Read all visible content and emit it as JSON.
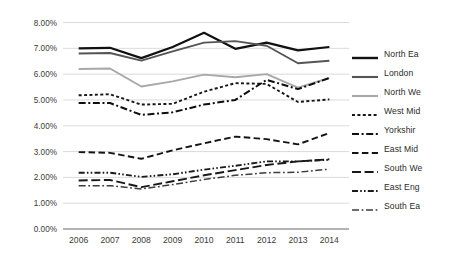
{
  "chart_data": {
    "type": "line",
    "title": "",
    "xlabel": "",
    "ylabel": "",
    "categories": [
      "2006",
      "2007",
      "2008",
      "2009",
      "2010",
      "2011",
      "2012",
      "2013",
      "2014"
    ],
    "x_tick_labels": [
      "2006",
      "2007",
      "2008",
      "2009",
      "2010",
      "2011",
      "2012",
      "2013",
      "2014"
    ],
    "y_tick_labels": [
      "0.00%",
      "1.00%",
      "2.00%",
      "3.00%",
      "4.00%",
      "5.00%",
      "6.00%",
      "7.00%",
      "8.00%"
    ],
    "y_tick_values": [
      0,
      1,
      2,
      3,
      4,
      5,
      6,
      7,
      8
    ],
    "ylim": [
      0,
      8
    ],
    "grid": "horizontal",
    "legend_position": "right",
    "value_suffix": "%",
    "series": [
      {
        "name": "North Ea",
        "color": "#111111",
        "style": "solid",
        "width": 2.2,
        "values": [
          7.0,
          7.02,
          6.62,
          7.05,
          7.6,
          6.98,
          7.22,
          6.92,
          7.05
        ]
      },
      {
        "name": "London",
        "color": "#555555",
        "style": "solid",
        "width": 1.9,
        "values": [
          6.8,
          6.82,
          6.52,
          6.88,
          7.22,
          7.28,
          7.1,
          6.42,
          6.52
        ]
      },
      {
        "name": "North We",
        "color": "#a8a8a8",
        "style": "solid",
        "width": 1.9,
        "values": [
          6.2,
          6.22,
          5.52,
          5.72,
          5.98,
          5.88,
          6.0,
          5.48,
          5.85
        ]
      },
      {
        "name": "West Mid",
        "color": "#151515",
        "style": "dotted-short",
        "width": 1.9,
        "values": [
          5.18,
          5.22,
          4.82,
          4.85,
          5.32,
          5.65,
          5.62,
          4.92,
          5.02
        ]
      },
      {
        "name": "Yorkshir",
        "color": "#0e0e0e",
        "style": "dash-dot",
        "width": 2.0,
        "values": [
          4.88,
          4.88,
          4.42,
          4.52,
          4.82,
          5.0,
          5.78,
          5.42,
          5.85
        ]
      },
      {
        "name": "East Mid",
        "color": "#141414",
        "style": "dashed-medium",
        "width": 1.9,
        "values": [
          2.98,
          2.95,
          2.72,
          3.05,
          3.32,
          3.58,
          3.48,
          3.28,
          3.72
        ]
      },
      {
        "name": "South We",
        "color": "#181818",
        "style": "dashed-long",
        "width": 1.9,
        "values": [
          1.88,
          1.9,
          1.62,
          1.85,
          2.08,
          2.28,
          2.48,
          2.62,
          2.7
        ]
      },
      {
        "name": "East Eng",
        "color": "#1a1a1a",
        "style": "dash-dot-dot",
        "width": 1.9,
        "values": [
          2.18,
          2.18,
          2.02,
          2.12,
          2.3,
          2.45,
          2.62,
          2.62,
          2.68
        ]
      },
      {
        "name": "South Ea",
        "color": "#3c3c3c",
        "style": "dash-dot-thin",
        "width": 1.5,
        "values": [
          1.68,
          1.68,
          1.55,
          1.72,
          1.92,
          2.08,
          2.18,
          2.2,
          2.32
        ]
      }
    ]
  },
  "legend": {
    "items": [
      {
        "label": "North Ea"
      },
      {
        "label": "London"
      },
      {
        "label": "North We"
      },
      {
        "label": "West Mid"
      },
      {
        "label": "Yorkshir"
      },
      {
        "label": "East Mid"
      },
      {
        "label": "South We"
      },
      {
        "label": "East Eng"
      },
      {
        "label": "South Ea"
      }
    ]
  }
}
